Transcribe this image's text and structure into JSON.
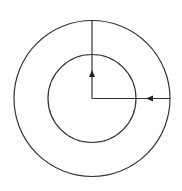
{
  "diagram": {
    "type": "concentric-circles-with-arrows",
    "stroke_color": "#333333",
    "background": "#ffffff",
    "center": {
      "x": 92,
      "y": 98.5
    },
    "outer_circle": {
      "radius": 78
    },
    "inner_circle": {
      "radius": 44
    },
    "lines": [
      {
        "name": "vertical-radius",
        "from": {
          "x": 92,
          "y": 20.5
        },
        "to": {
          "x": 92,
          "y": 98.5
        },
        "arrow": {
          "direction": "up",
          "tip": {
            "x": 92,
            "y": 70
          }
        }
      },
      {
        "name": "horizontal-radius",
        "from": {
          "x": 170,
          "y": 98.5
        },
        "to": {
          "x": 92,
          "y": 98.5
        },
        "arrow": {
          "direction": "left",
          "tip": {
            "x": 146,
            "y": 98.5
          }
        }
      }
    ]
  }
}
